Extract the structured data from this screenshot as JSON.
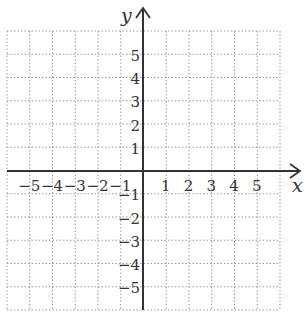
{
  "chart_data": {
    "type": "coordinate-plane",
    "title": "",
    "xlabel": "x",
    "ylabel": "y",
    "xlim": [
      -6,
      6
    ],
    "ylim": [
      -6,
      6
    ],
    "grid": true,
    "grid_style": "dotted",
    "x_ticks": [
      -5,
      -4,
      -3,
      -2,
      -1,
      1,
      2,
      3,
      4,
      5
    ],
    "y_ticks": [
      5,
      4,
      3,
      2,
      1,
      -1,
      -2,
      -3,
      -4,
      -5
    ],
    "x_tick_labels": [
      "−5",
      "−4",
      "−3",
      "−2",
      "−1",
      "1",
      "2",
      "3",
      "4",
      "5"
    ],
    "y_tick_labels": [
      "5",
      "4",
      "3",
      "2",
      "1",
      "−1",
      "−2",
      "−3",
      "−4",
      "−5"
    ],
    "series": []
  },
  "colors": {
    "grid": "#9a9a9a",
    "axis": "#333333",
    "text": "#333333"
  },
  "labels": {
    "x_axis": "x",
    "y_axis": "y"
  }
}
